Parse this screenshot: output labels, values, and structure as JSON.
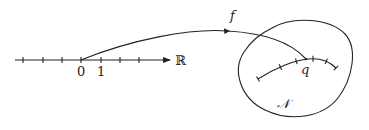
{
  "diagram": {
    "real_line": {
      "label": "ℝ",
      "tick_labels": [
        "0",
        "1"
      ]
    },
    "map_label": "f",
    "manifold_label": "𝒩",
    "point_label": "q",
    "colors": {
      "ink": "#222222",
      "background": "#ffffff"
    }
  }
}
